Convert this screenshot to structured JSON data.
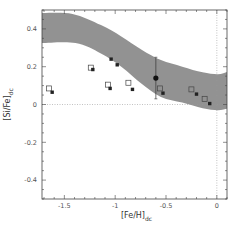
{
  "chart_data": {
    "type": "scatter",
    "title": "",
    "xlabel": "[Fe/H]",
    "xlabel_sub": "dc",
    "ylabel": "[Si/Fe]",
    "ylabel_sub": "dc",
    "xlim": [
      -1.72,
      0.1
    ],
    "ylim": [
      -0.5,
      0.5
    ],
    "x_ticks": [
      -1.5,
      -1,
      -0.5,
      0
    ],
    "x_tick_labels": [
      "-1.5",
      "-1",
      "-0.5",
      "0"
    ],
    "y_ticks": [
      -0.4,
      -0.2,
      0,
      0.2,
      0.4
    ],
    "y_tick_labels": [
      "-0.4",
      "-0.2",
      "0",
      "0.2",
      "0.4"
    ],
    "grid": false,
    "reference_lines": {
      "x": 0,
      "y": 0,
      "style": "dotted"
    },
    "band": {
      "name": "model region",
      "color": "#8c8c8c",
      "upper": [
        [
          -1.72,
          0.484
        ],
        [
          -1.42,
          0.479
        ],
        [
          -1.14,
          0.42
        ],
        [
          -0.94,
          0.36
        ],
        [
          -0.74,
          0.29
        ],
        [
          -0.55,
          0.235
        ],
        [
          -0.34,
          0.2
        ],
        [
          -0.14,
          0.17
        ],
        [
          0.01,
          0.16
        ],
        [
          0.1,
          0.172
        ]
      ],
      "lower": [
        [
          -1.72,
          0.325
        ],
        [
          -1.39,
          0.325
        ],
        [
          -1.14,
          0.27
        ],
        [
          -0.94,
          0.2
        ],
        [
          -0.74,
          0.11
        ],
        [
          -0.55,
          0.04
        ],
        [
          -0.34,
          0.01
        ],
        [
          -0.14,
          -0.02
        ],
        [
          0.01,
          -0.03
        ],
        [
          0.1,
          -0.022
        ]
      ]
    },
    "series": [
      {
        "name": "open squares",
        "marker": "open-square",
        "points": [
          [
            -1.65,
            0.085
          ],
          [
            -1.24,
            0.195
          ],
          [
            -1.07,
            0.105
          ],
          [
            -0.87,
            0.115
          ],
          [
            -0.56,
            0.085
          ],
          [
            -0.25,
            0.08
          ],
          [
            -0.12,
            0.03
          ]
        ]
      },
      {
        "name": "filled squares",
        "marker": "filled-square",
        "points": [
          [
            -1.62,
            0.065
          ],
          [
            -1.22,
            0.185
          ],
          [
            -1.05,
            0.085
          ],
          [
            -1.04,
            0.24
          ],
          [
            -0.98,
            0.21
          ],
          [
            -0.83,
            0.08
          ],
          [
            -0.53,
            0.06
          ],
          [
            -0.2,
            0.055
          ],
          [
            -0.07,
            0.005
          ]
        ]
      },
      {
        "name": "filled circle with error bar",
        "marker": "filled-circle",
        "points": [
          [
            -0.6,
            0.14
          ]
        ],
        "error_bar": {
          "x": -0.6,
          "low": 0.03,
          "high": 0.25
        }
      }
    ],
    "legend": null
  }
}
